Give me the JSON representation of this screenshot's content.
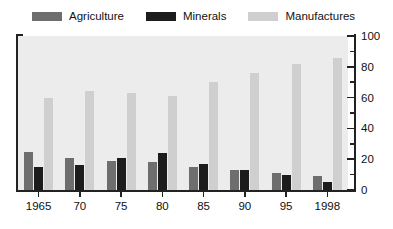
{
  "chart_data": {
    "type": "bar",
    "title": "",
    "subtitle": "",
    "xlabel": "",
    "ylabel": "",
    "categories": [
      "1965",
      "70",
      "75",
      "80",
      "85",
      "90",
      "95",
      "1998"
    ],
    "series": [
      {
        "name": "Agriculture",
        "color": "#6e6e6e",
        "values": [
          25,
          21,
          19,
          18,
          15,
          13,
          11,
          9
        ]
      },
      {
        "name": "Minerals",
        "color": "#1c1c1c",
        "values": [
          15,
          16,
          21,
          24,
          17,
          13,
          10,
          5
        ]
      },
      {
        "name": "Manufactures",
        "color": "#cfcfcf",
        "values": [
          60,
          64,
          63,
          61,
          70,
          76,
          82,
          86
        ]
      }
    ],
    "ylim": [
      0,
      100
    ],
    "yticks": [
      0,
      20,
      40,
      60,
      80,
      100
    ],
    "ytick_labels": [
      "0",
      "20",
      "40",
      "60",
      "80",
      "100"
    ],
    "yminor_ticks": [
      10,
      30,
      50,
      70,
      90
    ],
    "grid": false,
    "legend_position": "top-left",
    "plot_background": "#ececec"
  },
  "legend": {
    "items": [
      {
        "label": "Agriculture",
        "color": "#6e6e6e"
      },
      {
        "label": "Minerals",
        "color": "#1c1c1c"
      },
      {
        "label": "Manufactures",
        "color": "#cfcfcf"
      }
    ]
  },
  "axes": {
    "y_labels": [
      "100",
      "80",
      "60",
      "40",
      "20",
      "0"
    ],
    "x_labels": [
      "1965",
      "70",
      "75",
      "80",
      "85",
      "90",
      "95",
      "1998"
    ]
  }
}
